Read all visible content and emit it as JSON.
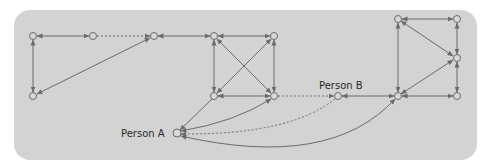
{
  "diagram": {
    "type": "network-graph",
    "colors": {
      "panel": "#d3d3d3",
      "line": "#6a6a6a",
      "node_fill": "#d8d8d8",
      "text": "#2a2a2a"
    },
    "labels": {
      "person_a": "Person A",
      "person_b": "Person B"
    },
    "nodes": [
      {
        "id": "n1",
        "x": 33,
        "y": 36
      },
      {
        "id": "n2",
        "x": 93,
        "y": 36
      },
      {
        "id": "n3",
        "x": 154,
        "y": 36
      },
      {
        "id": "n4",
        "x": 33,
        "y": 96
      },
      {
        "id": "n5",
        "x": 214,
        "y": 36
      },
      {
        "id": "n6",
        "x": 274,
        "y": 36
      },
      {
        "id": "n7",
        "x": 214,
        "y": 96
      },
      {
        "id": "n8",
        "x": 274,
        "y": 96
      },
      {
        "id": "personB",
        "x": 338,
        "y": 96,
        "label": "Person B"
      },
      {
        "id": "n10",
        "x": 398,
        "y": 19
      },
      {
        "id": "n11",
        "x": 457,
        "y": 19
      },
      {
        "id": "n12",
        "x": 457,
        "y": 58
      },
      {
        "id": "n13",
        "x": 398,
        "y": 96
      },
      {
        "id": "n14",
        "x": 457,
        "y": 96
      },
      {
        "id": "personA",
        "x": 177,
        "y": 133,
        "label": "Person A"
      }
    ],
    "edges": [
      {
        "from": "n1",
        "to": "n2",
        "style": "solid",
        "arrows": "both"
      },
      {
        "from": "n2",
        "to": "n3",
        "style": "dotted",
        "arrows": "end"
      },
      {
        "from": "n1",
        "to": "n4",
        "style": "solid",
        "arrows": "both"
      },
      {
        "from": "n4",
        "to": "n3",
        "style": "solid",
        "arrows": "both"
      },
      {
        "from": "n3",
        "to": "n5",
        "style": "solid",
        "arrows": "both"
      },
      {
        "from": "n5",
        "to": "n6",
        "style": "solid",
        "arrows": "both"
      },
      {
        "from": "n5",
        "to": "n7",
        "style": "solid",
        "arrows": "both"
      },
      {
        "from": "n6",
        "to": "n8",
        "style": "solid",
        "arrows": "both"
      },
      {
        "from": "n7",
        "to": "n8",
        "style": "solid",
        "arrows": "both"
      },
      {
        "from": "n5",
        "to": "n8",
        "style": "solid",
        "arrows": "both"
      },
      {
        "from": "n6",
        "to": "n7",
        "style": "solid",
        "arrows": "both"
      },
      {
        "from": "n8",
        "to": "personB",
        "style": "dotted",
        "arrows": "end"
      },
      {
        "from": "personB",
        "to": "n13",
        "style": "solid",
        "arrows": "both"
      },
      {
        "from": "n10",
        "to": "n11",
        "style": "solid",
        "arrows": "both"
      },
      {
        "from": "n10",
        "to": "n13",
        "style": "solid",
        "arrows": "both"
      },
      {
        "from": "n11",
        "to": "n12",
        "style": "solid",
        "arrows": "both"
      },
      {
        "from": "n10",
        "to": "n12",
        "style": "solid",
        "arrows": "both"
      },
      {
        "from": "n12",
        "to": "n13",
        "style": "solid",
        "arrows": "both"
      },
      {
        "from": "n12",
        "to": "n14",
        "style": "solid",
        "arrows": "both"
      },
      {
        "from": "n13",
        "to": "n14",
        "style": "solid",
        "arrows": "both"
      },
      {
        "from": "n7",
        "to": "personA",
        "style": "solid",
        "arrows": "end"
      },
      {
        "from": "n8",
        "to": "personA",
        "style": "solid",
        "arrows": "both",
        "curved": true
      },
      {
        "from": "personB",
        "to": "personA",
        "style": "dotted",
        "arrows": "end",
        "curved": true
      },
      {
        "from": "n13",
        "to": "personA",
        "style": "solid",
        "arrows": "both",
        "curved": true
      }
    ]
  }
}
